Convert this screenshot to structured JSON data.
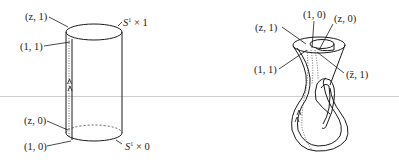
{
  "figure": {
    "scan_line_color": "#cfcfcf",
    "left_diagram": {
      "name": "cylinder S1 x I",
      "labels": {
        "top_left_point": "(z, 1)",
        "top_seam_point": "(1, 1)",
        "top_circle": "S",
        "top_circle_sup": "1",
        "top_circle_suffix": " × 1",
        "bottom_left_point": "(z, 0)",
        "bottom_seam_point": "(1, 0)",
        "bottom_circle": "S",
        "bottom_circle_sup": "1",
        "bottom_circle_suffix": " × 0"
      }
    },
    "right_diagram": {
      "name": "Klein bottle",
      "labels": {
        "top_center_point": "(1, 0)",
        "top_right_point": "(z, 0)",
        "left_upper_point": "(z, 1)",
        "left_lower_point": "(1, 1)",
        "right_point": "(z̄, 1)"
      }
    }
  }
}
